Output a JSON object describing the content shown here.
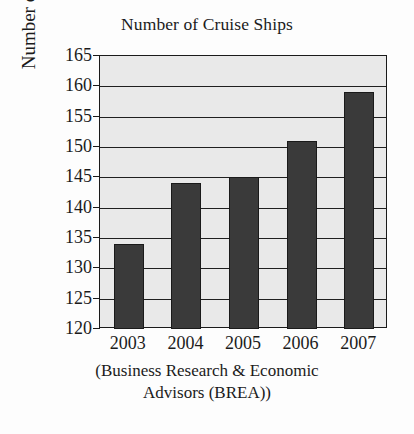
{
  "chart_data": {
    "type": "bar",
    "title": "Number of Cruise Ships",
    "xlabel": "",
    "ylabel": "Number of ships",
    "categories": [
      "2003",
      "2004",
      "2005",
      "2006",
      "2007"
    ],
    "values": [
      134,
      144,
      145,
      151,
      159
    ],
    "series": [
      {
        "name": "Number of ships",
        "values": [
          134,
          144,
          145,
          151,
          159
        ]
      }
    ],
    "ylim": [
      120,
      165
    ],
    "ytick_step": 5,
    "yticks": [
      120,
      125,
      130,
      135,
      140,
      145,
      150,
      155,
      160,
      165
    ],
    "ytick_labels": [
      "120",
      "125",
      "130",
      "135",
      "140",
      "145",
      "150",
      "155",
      "160",
      "165"
    ],
    "grid": true,
    "grid_axis": "y",
    "legend": false,
    "legend_position": "none",
    "caption_lines": [
      "(Business Research & Economic Advisors",
      "Advisors (BREA))"
    ],
    "annotations": []
  },
  "caption": {
    "line1": "(Business Research & Economic",
    "line2": "Advisors (BREA))"
  },
  "colors": {
    "bar_fill": "#3a3a3a",
    "bar_edge": "#1a1a1a",
    "plot_background": "#e9e9e9",
    "page_background": "#fdfdfd",
    "axis": "#1a1a1a",
    "gridline": "#1f1f1f",
    "text": "#1b1b1b"
  }
}
